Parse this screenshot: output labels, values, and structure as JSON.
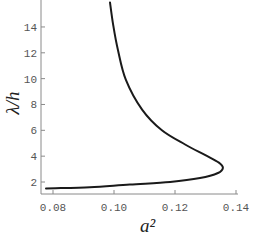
{
  "chart_data": {
    "type": "line",
    "title": "",
    "xlabel": "a²",
    "ylabel": "λ/h",
    "xlim": [
      0.0767,
      0.14
    ],
    "ylim": [
      1.07,
      16.1
    ],
    "grid": false,
    "legend": null,
    "x_ticks": [
      0.08,
      0.1,
      0.12,
      0.14
    ],
    "x_tick_labels": [
      "0.08",
      "0.10",
      "0.12",
      "0.14"
    ],
    "y_ticks": [
      2,
      4,
      6,
      8,
      10,
      12,
      14
    ],
    "y_tick_labels": [
      "2",
      "4",
      "6",
      "8",
      "10",
      "12",
      "14"
    ],
    "series": [
      {
        "name": "curve",
        "color": "#1a1a1a",
        "x": [
          0.0987,
          0.0997,
          0.1013,
          0.1039,
          0.1092,
          0.1157,
          0.1233,
          0.1298,
          0.1344,
          0.1357,
          0.1341,
          0.1282,
          0.1184,
          0.1052,
          0.0921,
          0.0777
        ],
        "y": [
          15.9,
          14.2,
          12.2,
          9.9,
          7.6,
          6.0,
          4.9,
          4.1,
          3.5,
          3.1,
          2.7,
          2.3,
          2.0,
          1.8,
          1.6,
          1.5
        ]
      }
    ]
  }
}
